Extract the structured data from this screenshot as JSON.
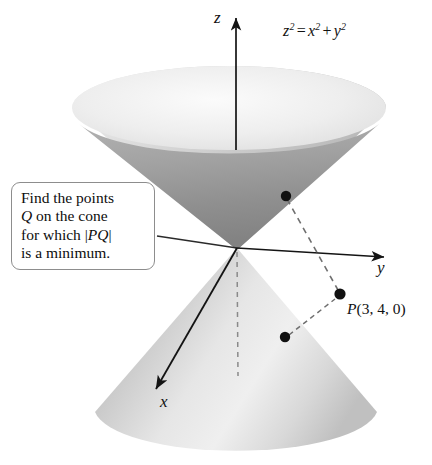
{
  "figure": {
    "kind": "3d-double-cone-diagram",
    "width": 432,
    "height": 465,
    "background": "#ffffff"
  },
  "equation": {
    "text": "z² = x² + y²",
    "base_z": "z",
    "exp_z": "2",
    "equals": "=",
    "base_x": "x",
    "exp_x": "2",
    "plus": "+",
    "base_y": "y",
    "exp_y": "2"
  },
  "axes": {
    "z": {
      "label": "z",
      "direction": "up",
      "origin": [
        237,
        248
      ],
      "tip": [
        236,
        16
      ]
    },
    "y": {
      "label": "y",
      "direction": "right-down",
      "origin": [
        237,
        248
      ],
      "tip": [
        386,
        257
      ]
    },
    "x": {
      "label": "x",
      "direction": "left-down-front",
      "origin": [
        237,
        248
      ],
      "tip": [
        153,
        393
      ]
    }
  },
  "callout": {
    "line1": "Find the points",
    "line2_italic": "Q",
    "line2_rest": " on the cone",
    "line3_prefix": "for which ",
    "line3_bar_open": "|",
    "line3_italic": "PQ",
    "line3_bar_close": "|",
    "line4": "is a minimum.",
    "border_color": "#8d8d8d",
    "background": "#ffffff"
  },
  "points": [
    {
      "name": "Q-upper",
      "label": "",
      "x": 286,
      "y": 196,
      "radius": 5.2
    },
    {
      "name": "Q-lower",
      "label": "",
      "x": 285,
      "y": 337,
      "radius": 5.2
    },
    {
      "name": "P",
      "label": "P(3, 4, 0)",
      "label_italic": "P",
      "label_rest": "(3, 4, 0)",
      "x": 340,
      "y": 294,
      "radius": 5.6
    }
  ],
  "connectors": [
    {
      "name": "dash-Q-upper-to-P",
      "from": [
        286,
        196
      ],
      "to": [
        340,
        294
      ],
      "style": "dashed"
    },
    {
      "name": "dash-Q-lower-to-P",
      "from": [
        285,
        337
      ],
      "to": [
        340,
        294
      ],
      "style": "dashed"
    },
    {
      "name": "dash-axis-z-negative",
      "from": [
        237,
        250
      ],
      "to": [
        238,
        376
      ],
      "style": "dashed"
    },
    {
      "name": "callout-leader",
      "from": [
        157,
        236
      ],
      "to": [
        237,
        248
      ],
      "style": "solid"
    }
  ],
  "colors": {
    "cone_outer_light": "#e8e8e8",
    "cone_outer_mid": "#c9c9c9",
    "cone_inner_dark": "#9a9a9a",
    "cone_lower_light": "#efefef",
    "cone_lower_mid": "#c4c4c4",
    "axis": "#1a1a1a",
    "point": "#111111",
    "dash": "#6f6f6f",
    "text": "#111111"
  }
}
